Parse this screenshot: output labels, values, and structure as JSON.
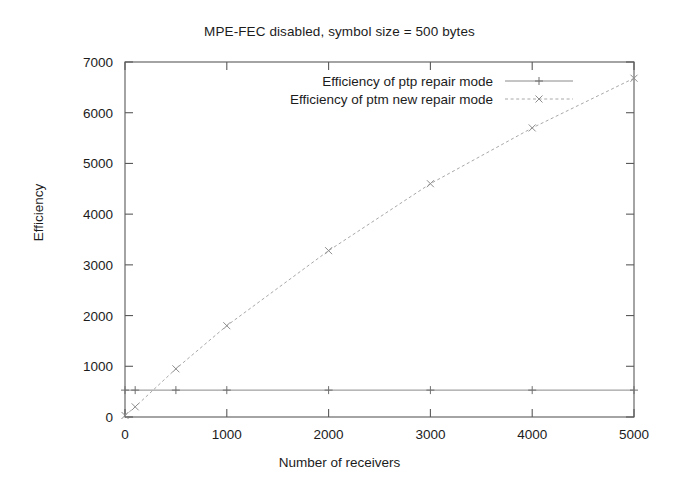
{
  "chart_data": {
    "type": "line",
    "title": "MPE-FEC disabled, symbol size = 500 bytes",
    "xlabel": "Number of receivers",
    "ylabel": "Efficiency",
    "xlim": [
      0,
      5000
    ],
    "ylim": [
      0,
      7000
    ],
    "xticks": [
      "0",
      "1000",
      "2000",
      "3000",
      "4000",
      "5000"
    ],
    "xtick_values": [
      0,
      1000,
      2000,
      3000,
      4000,
      5000
    ],
    "yticks": [
      "0",
      "1000",
      "2000",
      "3000",
      "4000",
      "5000",
      "6000",
      "7000"
    ],
    "ytick_values": [
      0,
      1000,
      2000,
      3000,
      4000,
      5000,
      6000,
      7000
    ],
    "grid": false,
    "legend_position": "top-center-inside",
    "series": [
      {
        "name": "Efficiency of ptp repair mode",
        "marker": "plus",
        "line_style": "solid",
        "color": "#8a8a8a",
        "x": [
          0,
          100,
          500,
          1000,
          2000,
          3000,
          4000,
          5000
        ],
        "values": [
          530,
          530,
          530,
          530,
          530,
          530,
          530,
          530
        ]
      },
      {
        "name": "Efficiency of ptm new repair mode",
        "marker": "cross",
        "line_style": "dashed",
        "color": "#a8a8a8",
        "x": [
          0,
          100,
          500,
          1000,
          2000,
          3000,
          4000,
          5000
        ],
        "values": [
          30,
          200,
          950,
          1800,
          3280,
          4600,
          5700,
          6680
        ]
      }
    ]
  },
  "legend": {
    "entries": [
      {
        "label": "Efficiency of ptp repair mode"
      },
      {
        "label": "Efficiency of ptm new repair mode"
      }
    ]
  }
}
